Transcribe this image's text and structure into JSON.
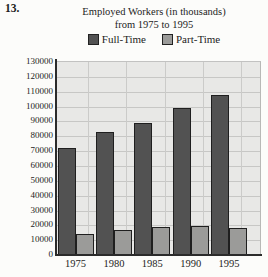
{
  "page": {
    "problem_number": "13."
  },
  "chart": {
    "title_line1": "Employed Workers (in thousands)",
    "title_line2": "from 1975 to 1995"
  },
  "chart_data": {
    "type": "bar",
    "title": "Employed Workers (in thousands) from 1975 to 1995",
    "categories": [
      "1975",
      "1980",
      "1985",
      "1990",
      "1995"
    ],
    "series": [
      {
        "name": "Full-Time",
        "color": "#525252",
        "values": [
          72000,
          83000,
          89000,
          99000,
          108000
        ]
      },
      {
        "name": "Part-Time",
        "color": "#9b9b99",
        "values": [
          14000,
          17000,
          19000,
          19500,
          18000
        ]
      }
    ],
    "xlabel": "",
    "ylabel": "",
    "ylim": [
      0,
      130000
    ],
    "ytick_step": 10000,
    "yticks": [
      "0",
      "10000",
      "20000",
      "30000",
      "40000",
      "50000",
      "60000",
      "70000",
      "80000",
      "90000",
      "100000",
      "110000",
      "120000",
      "130000"
    ],
    "grid": true,
    "legend_position": "top",
    "plot_background": "#e8e8e6",
    "gridline_color": "#c7c7c5",
    "axis_color": "#2b2b2b"
  }
}
